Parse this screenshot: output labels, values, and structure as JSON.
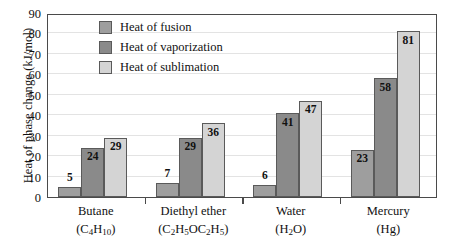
{
  "chart_data": {
    "type": "bar",
    "title": "",
    "xlabel": "",
    "ylabel": "Heat of phase change (kJ/mol)",
    "ylim": [
      0,
      90
    ],
    "ytick_step": 10,
    "yticks": [
      0,
      10,
      20,
      30,
      40,
      50,
      60,
      70,
      80,
      90
    ],
    "grid": true,
    "legend_position": "top-left-inside",
    "categories": [
      "Butane",
      "Diethyl ether",
      "Water",
      "Mercury"
    ],
    "category_formulas": [
      "(C4H10)",
      "(C2H5OC2H5)",
      "(H2O)",
      "(Hg)"
    ],
    "series": [
      {
        "name": "Heat of fusion",
        "color": "#9e9e9e",
        "values": [
          5,
          7,
          6,
          23
        ]
      },
      {
        "name": "Heat of vaporization",
        "color": "#8a8a8a",
        "values": [
          24,
          29,
          41,
          58
        ]
      },
      {
        "name": "Heat of sublimation",
        "color": "#d4d4d4",
        "values": [
          29,
          36,
          47,
          81
        ]
      }
    ]
  },
  "axis": {
    "y_title": "Heat of phase change (kJ/mol)"
  },
  "legend": {
    "items": [
      {
        "label": "Heat of fusion"
      },
      {
        "label": "Heat of vaporization"
      },
      {
        "label": "Heat of sublimation"
      }
    ]
  },
  "colors": {
    "fusion": "#9e9e9e",
    "vaporization": "#8a8a8a",
    "sublimation": "#d4d4d4",
    "frame": "#4a4a4a",
    "gridline": "#e3e3e3",
    "text": "#111111"
  }
}
